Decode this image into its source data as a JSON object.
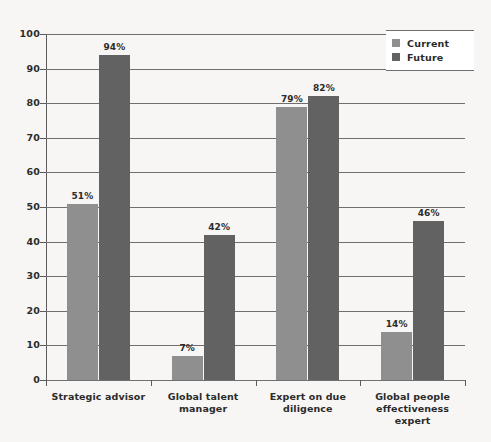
{
  "chart_data": {
    "type": "bar",
    "title": "",
    "subtitle": "",
    "xlabel": "",
    "ylabel": "",
    "ylim": [
      0,
      100
    ],
    "ytick_step": 10,
    "yticks": [
      "100",
      "90",
      "80",
      "70",
      "60",
      "50",
      "40",
      "30",
      "20",
      "10",
      "0"
    ],
    "grid": true,
    "legend_position": "top-right",
    "categories": [
      "Strategic advisor",
      "Global talent manager",
      "Expert on due diligence",
      "Global people effectiveness expert"
    ],
    "category_lines": [
      [
        "Strategic advisor"
      ],
      [
        "Global talent",
        "manager"
      ],
      [
        "Expert on due",
        "diligence"
      ],
      [
        "Global people",
        "effectiveness expert"
      ]
    ],
    "series": [
      {
        "name": "Current",
        "color": "#8f8f8f",
        "values": [
          51,
          7,
          79,
          14
        ],
        "labels": [
          "51%",
          "7%",
          "79%",
          "14%"
        ]
      },
      {
        "name": "Future",
        "color": "#626262",
        "values": [
          94,
          42,
          82,
          46
        ],
        "labels": [
          "94%",
          "42%",
          "82%",
          "46%"
        ]
      }
    ]
  },
  "legend": {
    "items": [
      {
        "label": "Current",
        "color": "#8f8f8f"
      },
      {
        "label": "Future",
        "color": "#626262"
      }
    ]
  }
}
